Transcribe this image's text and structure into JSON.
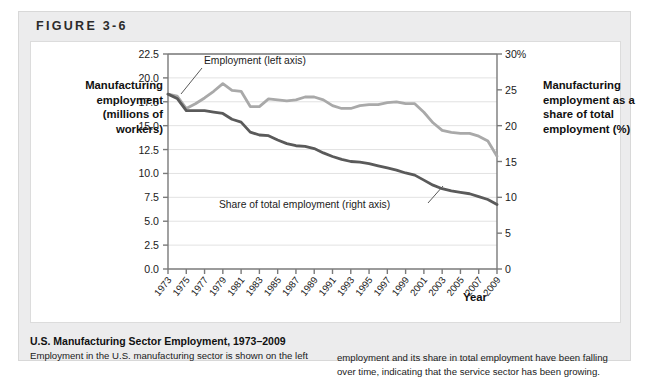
{
  "figure": {
    "label": "FIGURE 3-6"
  },
  "axes": {
    "left_title": "Manufacturing employment (millions of workers)",
    "right_title": "Manufacturing employment as a share of total employment (%)",
    "x_title": "Year"
  },
  "annotations": {
    "series1": "Employment (left axis)",
    "series2": "Share of total employment (right axis)"
  },
  "caption": {
    "title": "U.S. Manufacturing Sector Employment, 1973–2009",
    "left_line1": "Employment in the U.S. manufacturing sector is shown on the left",
    "right_line1": "employment and its share in total employment have been falling",
    "right_line2": "over time, indicating that the service sector has been growing."
  },
  "colors": {
    "series1": "#a9a9a9",
    "series2": "#5a5a5a",
    "grid": "#e2e2e2",
    "axis": "#7a7a7a",
    "card_bg": "#ececed",
    "panel_bg": "#ffffff"
  },
  "chart_data": {
    "type": "line",
    "title": "U.S. Manufacturing Sector Employment, 1973–2009",
    "xlabel": "Year",
    "ylabel": "Manufacturing employment (millions of workers)",
    "y2label": "Manufacturing employment as a share of total employment (%)",
    "xlim": [
      1973,
      2009
    ],
    "ylim": [
      0.0,
      22.5
    ],
    "y2lim": [
      0,
      30
    ],
    "yticks": [
      "0.0",
      "2.5",
      "5.0",
      "7.5",
      "10.0",
      "12.5",
      "15.0",
      "17.5",
      "20.0",
      "22.5"
    ],
    "ytick_values": [
      0.0,
      2.5,
      5.0,
      7.5,
      10.0,
      12.5,
      15.0,
      17.5,
      20.0,
      22.5
    ],
    "y2ticks": [
      "0",
      "5",
      "10",
      "15",
      "20",
      "25",
      "30%"
    ],
    "y2tick_values": [
      0,
      5,
      10,
      15,
      20,
      25,
      30
    ],
    "xticks": [
      1973,
      1975,
      1977,
      1979,
      1981,
      1983,
      1985,
      1987,
      1989,
      1991,
      1993,
      1995,
      1997,
      1999,
      2001,
      2003,
      2005,
      2007,
      2009
    ],
    "grid": true,
    "legend": "annotated-inline",
    "x": [
      1973,
      1974,
      1975,
      1976,
      1977,
      1978,
      1979,
      1980,
      1981,
      1982,
      1983,
      1984,
      1985,
      1986,
      1987,
      1988,
      1989,
      1990,
      1991,
      1992,
      1993,
      1994,
      1995,
      1996,
      1997,
      1998,
      1999,
      2000,
      2001,
      2002,
      2003,
      2004,
      2005,
      2006,
      2007,
      2008,
      2009
    ],
    "series": [
      {
        "name": "Employment (left axis)",
        "axis": "left",
        "units": "millions of workers",
        "color": "#a9a9a9",
        "values": [
          18.3,
          18.1,
          16.8,
          17.3,
          17.9,
          18.6,
          19.4,
          18.7,
          18.6,
          17.0,
          17.0,
          17.8,
          17.7,
          17.6,
          17.7,
          18.0,
          18.0,
          17.7,
          17.1,
          16.8,
          16.8,
          17.1,
          17.2,
          17.2,
          17.4,
          17.5,
          17.3,
          17.3,
          16.4,
          15.3,
          14.5,
          14.3,
          14.2,
          14.2,
          13.9,
          13.4,
          11.8
        ]
      },
      {
        "name": "Share of total employment (right axis)",
        "axis": "right",
        "units": "percent",
        "color": "#5a5a5a",
        "values": [
          24.4,
          23.8,
          22.1,
          22.1,
          22.1,
          21.9,
          21.7,
          20.9,
          20.5,
          19.1,
          18.7,
          18.6,
          18.0,
          17.5,
          17.2,
          17.1,
          16.8,
          16.2,
          15.7,
          15.3,
          15.0,
          14.9,
          14.7,
          14.4,
          14.1,
          13.8,
          13.4,
          13.1,
          12.4,
          11.7,
          11.2,
          10.9,
          10.7,
          10.5,
          10.1,
          9.7,
          9.0
        ]
      }
    ]
  }
}
